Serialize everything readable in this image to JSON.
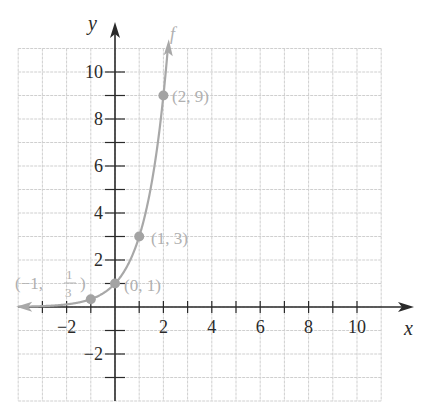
{
  "chart_data": {
    "type": "line",
    "title": "",
    "function_label": "f",
    "equation": "f(x) = 3^x",
    "xlabel": "x",
    "ylabel": "y",
    "xlim": [
      -4,
      11
    ],
    "ylim": [
      -4,
      11
    ],
    "grid": true,
    "x_ticks": [
      -2,
      2,
      4,
      6,
      8,
      10
    ],
    "y_ticks": [
      -2,
      2,
      4,
      6,
      8,
      10
    ],
    "x_tick_labels": [
      "−2",
      "2",
      "4",
      "6",
      "8",
      "10"
    ],
    "y_tick_labels": [
      "−2",
      "2",
      "4",
      "6",
      "8",
      "10"
    ],
    "points": [
      {
        "x": -1,
        "y": 0.3333,
        "label": "(−1, 1/3)"
      },
      {
        "x": 0,
        "y": 1,
        "label": "(0, 1)"
      },
      {
        "x": 1,
        "y": 3,
        "label": "(1, 3)"
      },
      {
        "x": 2,
        "y": 9,
        "label": "(2, 9)"
      }
    ],
    "series": [
      {
        "name": "f",
        "base": 3,
        "x_range": [
          -4,
          2.18
        ]
      }
    ]
  },
  "colors": {
    "grid": "#cfcfcf",
    "axis": "#2a2a2a",
    "curve": "#a8a8a8",
    "point": "#a3a3a3",
    "label_gray": "#b0b0b0",
    "text": "#2a2a2a"
  },
  "labels": {
    "x_axis": "x",
    "y_axis": "y",
    "curve": "f",
    "pt_neg1_prefix": "(−1,",
    "pt_neg1_num": "1",
    "pt_neg1_den": "3",
    "pt_neg1_suffix": ")",
    "pt_0": "(0, 1)",
    "pt_1": "(1, 3)",
    "pt_2": "(2, 9)"
  }
}
